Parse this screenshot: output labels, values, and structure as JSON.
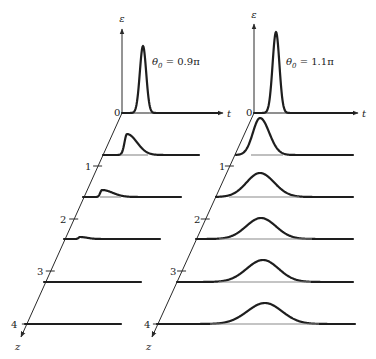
{
  "figure": {
    "width": 376,
    "height": 359,
    "axis_labels": {
      "epsilon": "ε",
      "t": "t",
      "z": "z",
      "origin": "0"
    },
    "tick_labels": [
      "1",
      "2",
      "3",
      "4"
    ],
    "colors": {
      "curve": "#1e1e1e",
      "axis": "#2a2a2a",
      "underline": "#8a8a8a"
    }
  },
  "panels": [
    {
      "id": "left",
      "label_main": "θ",
      "label_sub": "0",
      "label_rest": " = 0.9π",
      "label_pos": [
        152,
        65
      ],
      "eps_axis": {
        "x": 122,
        "y0": 113,
        "y1": 29,
        "label_y": 22
      },
      "t_axis_end": 223,
      "z_axis": {
        "x0": 122,
        "y0": 113,
        "x1": 21,
        "y1": 337
      },
      "z_label_pos": [
        15,
        350
      ],
      "ticks": [
        {
          "label": "1",
          "y": 166,
          "label_x": 85
        },
        {
          "label": "2",
          "y": 219,
          "label_x": 60
        },
        {
          "label": "3",
          "y": 271,
          "label_x": 37
        },
        {
          "label": "4",
          "y": 324,
          "label_x": 11
        }
      ],
      "rows": [
        {
          "z": 0,
          "x0": 122,
          "x1": 219,
          "y": 113,
          "peak": 143,
          "h": 67,
          "sL": 4.5,
          "sR": 4.5,
          "under": [
            137,
            149
          ]
        },
        {
          "z": 0.8,
          "x0": 103,
          "x1": 199,
          "y": 155,
          "peak": 127,
          "h": 21,
          "sL": 3.5,
          "sR": 14,
          "under": [
            121,
            148
          ]
        },
        {
          "z": 1.6,
          "x0": 83,
          "x1": 181,
          "y": 197,
          "peak": 102,
          "h": 7,
          "sL": 2.5,
          "sR": 15,
          "under": [
            100,
            121
          ]
        },
        {
          "z": 2.4,
          "x0": 64,
          "x1": 160,
          "y": 239,
          "peak": 80,
          "h": 2,
          "sL": 2,
          "sR": 10,
          "under": null
        },
        {
          "z": 3.2,
          "x0": 44,
          "x1": 141,
          "y": 282,
          "peak": 90,
          "h": 0,
          "sL": 5,
          "sR": 5,
          "under": null
        },
        {
          "z": 4,
          "x0": 25,
          "x1": 121,
          "y": 324,
          "peak": 70,
          "h": 0,
          "sL": 5,
          "sR": 5,
          "under": null
        }
      ]
    },
    {
      "id": "right",
      "label_main": "θ",
      "label_sub": "0",
      "label_rest": " = 1.1π",
      "label_pos": [
        286,
        65
      ],
      "eps_axis": {
        "x": 254,
        "y0": 113,
        "y1": 24,
        "label_y": 18
      },
      "t_axis_end": 358,
      "z_axis": {
        "x0": 254,
        "y0": 113,
        "x1": 152,
        "y1": 337
      },
      "z_label_pos": [
        146,
        350
      ],
      "ticks": [
        {
          "label": "1",
          "y": 166,
          "label_x": 219
        },
        {
          "label": "2",
          "y": 219,
          "label_x": 194
        },
        {
          "label": "3",
          "y": 271,
          "label_x": 170
        },
        {
          "label": "4",
          "y": 324,
          "label_x": 144
        }
      ],
      "rows": [
        {
          "z": 0,
          "x0": 254,
          "x1": 354,
          "y": 113,
          "peak": 276,
          "h": 81,
          "sL": 4.8,
          "sR": 4.8,
          "under": [
            268,
            282
          ]
        },
        {
          "z": 0.8,
          "x0": 236,
          "x1": 353,
          "y": 155,
          "peak": 260,
          "h": 37,
          "sL": 10,
          "sR": 13,
          "under": [
            251,
            283
          ]
        },
        {
          "z": 1.6,
          "x0": 216,
          "x1": 353,
          "y": 197,
          "peak": 260,
          "h": 24,
          "sL": 19,
          "sR": 20,
          "under": [
            229,
            299
          ]
        },
        {
          "z": 2.4,
          "x0": 196,
          "x1": 353,
          "y": 239,
          "peak": 261,
          "h": 21,
          "sL": 21,
          "sR": 21,
          "under": [
            219,
            312
          ]
        },
        {
          "z": 3.2,
          "x0": 177,
          "x1": 353,
          "y": 282,
          "peak": 263,
          "h": 22,
          "sL": 23,
          "sR": 22,
          "under": [
            219,
            311
          ]
        },
        {
          "z": 4,
          "x0": 157,
          "x1": 355,
          "y": 324,
          "peak": 265,
          "h": 21,
          "sL": 25,
          "sR": 24,
          "under": [
            210,
            319
          ]
        }
      ]
    }
  ]
}
